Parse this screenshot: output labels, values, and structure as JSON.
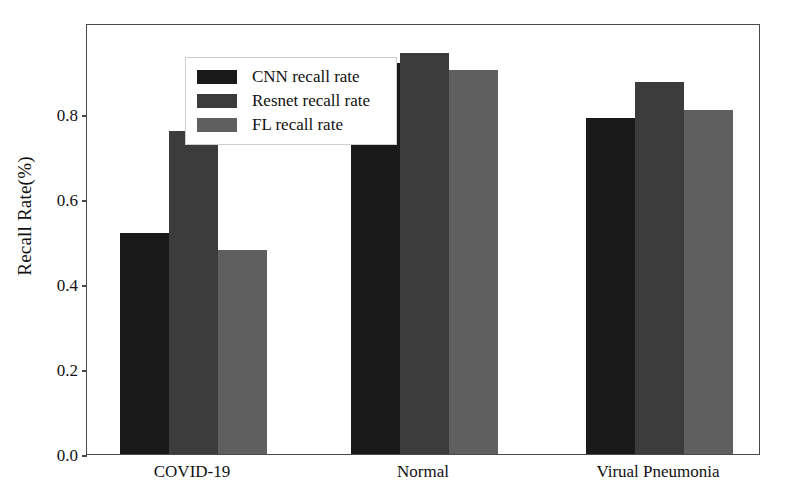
{
  "chart_data": {
    "type": "bar",
    "title": "",
    "xlabel": "",
    "ylabel": "Recall Rate(%)",
    "categories": [
      "COVID-19",
      "Normal",
      "Virual Pneumonia"
    ],
    "series": [
      {
        "name": "CNN recall rate",
        "color": "#1a1a1a",
        "values": [
          0.52,
          0.92,
          0.79
        ]
      },
      {
        "name": "Resnet recall rate",
        "color": "#3c3c3c",
        "values": [
          0.76,
          0.945,
          0.875
        ]
      },
      {
        "name": "FL recall rate",
        "color": "#5f5f5f",
        "values": [
          0.48,
          0.905,
          0.81
        ]
      }
    ],
    "ylim": [
      0.0,
      1.0145
    ],
    "yticks": [
      0.0,
      0.2,
      0.4,
      0.6,
      0.8
    ],
    "ytick_labels": [
      "0.0",
      "0.2",
      "0.4",
      "0.6",
      "0.8"
    ],
    "grid": false,
    "legend_position": "upper left",
    "frame": true
  },
  "legend": {
    "items": [
      {
        "label": "CNN recall rate"
      },
      {
        "label": "Resnet recall rate"
      },
      {
        "label": "FL recall rate"
      }
    ]
  },
  "axes": {
    "y_label": "Recall Rate(%)",
    "y_ticks": [
      "0.0",
      "0.2",
      "0.4",
      "0.6",
      "0.8"
    ],
    "x_ticks": [
      "COVID-19",
      "Normal",
      "Virual Pneumonia"
    ]
  }
}
